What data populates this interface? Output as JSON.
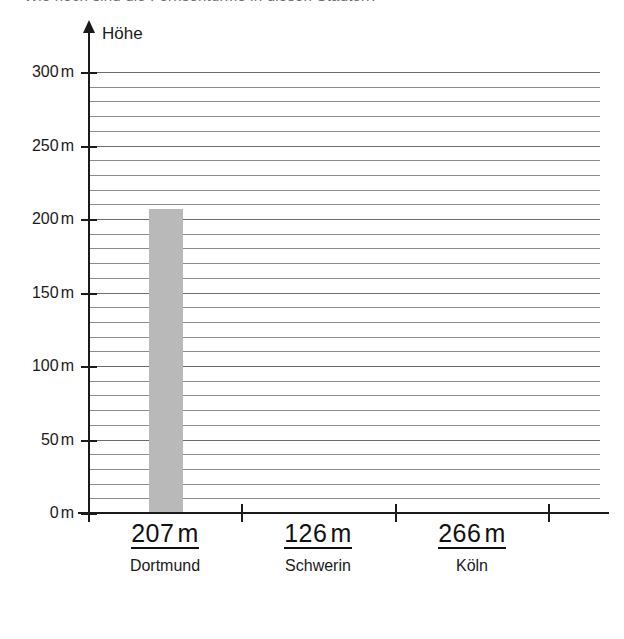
{
  "header": {
    "clipped_text": "Wie hoch sind die Fernsehtürme in diesen Städten?"
  },
  "chart": {
    "axis_title": "Höhe",
    "unit": "m"
  },
  "chart_data": {
    "type": "bar",
    "title": "",
    "subtitle": "",
    "xlabel": "",
    "ylabel": "Höhe",
    "unit": "m",
    "categories": [
      "Dortmund",
      "Schwerin",
      "Köln"
    ],
    "values": [
      207,
      126,
      266
    ],
    "value_labels": [
      "207 m",
      "126 m",
      "266 m"
    ],
    "bars_drawn": [
      true,
      false,
      false
    ],
    "ylim": [
      0,
      300
    ],
    "ytick_values": [
      0,
      50,
      100,
      150,
      200,
      250,
      300
    ],
    "ytick_labels": [
      "0 m",
      "50 m",
      "100 m",
      "150 m",
      "200 m",
      "250 m",
      "300 m"
    ],
    "grid": true,
    "grid_step": 10,
    "grid_orientation": "horizontal",
    "legend": "none",
    "bar_color": "#b9b9b9",
    "axis_color": "#1a1a1a",
    "grid_color": "#8c8c8c"
  },
  "y_axis": {
    "ticks": [
      {
        "label": "300",
        "unit": "m",
        "value": 300
      },
      {
        "label": "250",
        "unit": "m",
        "value": 250
      },
      {
        "label": "200",
        "unit": "m",
        "value": 200
      },
      {
        "label": "150",
        "unit": "m",
        "value": 150
      },
      {
        "label": "100",
        "unit": "m",
        "value": 100
      },
      {
        "label": "50",
        "unit": "m",
        "value": 50
      },
      {
        "label": "0",
        "unit": "m",
        "value": 0
      }
    ]
  },
  "categories": [
    {
      "value": "207",
      "unit": "m",
      "name": "Dortmund"
    },
    {
      "value": "126",
      "unit": "m",
      "name": "Schwerin"
    },
    {
      "value": "266",
      "unit": "m",
      "name": "Köln"
    }
  ]
}
